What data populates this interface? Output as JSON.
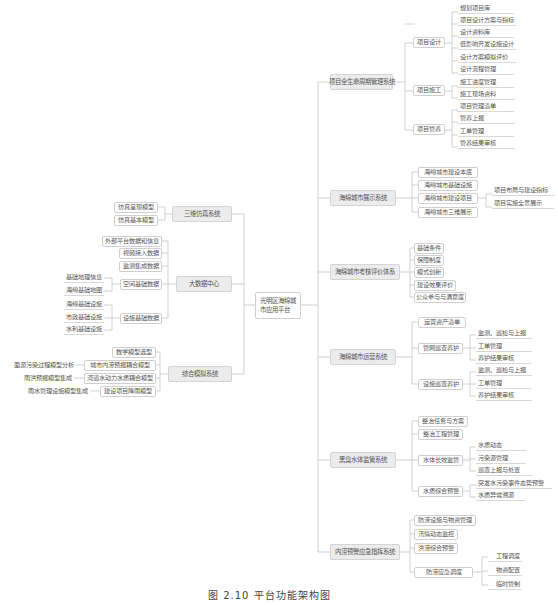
{
  "root": {
    "label": "光明区海绵城市应用平台"
  },
  "right_branches": [
    {
      "label": "项目全生命周期管理系统",
      "children": [
        {
          "label": "项目设计",
          "children": [
            "规划项目库",
            "项目设计方案与指标",
            "设计资料库",
            "低影响开发设施设计",
            "设计方案模拟评价",
            "设计流程管理"
          ]
        },
        {
          "label": "项目施工",
          "children": [
            "施工进度管理",
            "施工现场资料"
          ]
        },
        {
          "label": "项目管养",
          "children": [
            "项目管理清单",
            "管养上报",
            "工单管理",
            "管养结果审核"
          ]
        }
      ]
    },
    {
      "label": "海绵城市展示系统",
      "children": [
        {
          "label": "海绵城市建设本底",
          "children": []
        },
        {
          "label": "海绵城市基础设施",
          "children": []
        },
        {
          "label": "海绵城市建设项目",
          "children": [
            "项目布局与建设指标",
            "项目实施全景展示"
          ]
        },
        {
          "label": "海绵城市三维展示",
          "children": []
        }
      ]
    },
    {
      "label": "海绵城市考核评价体系",
      "children": [
        {
          "label": "基础条件",
          "children": []
        },
        {
          "label": "保障制度",
          "children": []
        },
        {
          "label": "模式创新",
          "children": []
        },
        {
          "label": "建设效果评价",
          "children": []
        },
        {
          "label": "公众参与与满意度",
          "children": []
        }
      ]
    },
    {
      "label": "海绵城市运营系统",
      "children": [
        {
          "label": "运营资产清单",
          "children": []
        },
        {
          "label": "管网巡查养护",
          "children": [
            "监测、巡检与上报",
            "工单管理",
            "养护结果审核"
          ]
        },
        {
          "label": "设施巡查养护",
          "children": [
            "监测、巡检与上报",
            "工单管理",
            "养护结果审核"
          ]
        }
      ]
    },
    {
      "label": "黑臭水体监管系统",
      "children": [
        {
          "label": "整治任务与方案",
          "children": []
        },
        {
          "label": "整治工程管理",
          "children": []
        },
        {
          "label": "水体长效监管",
          "children": [
            "水质动态",
            "污染源管理",
            "巡查上报与处置"
          ]
        },
        {
          "label": "水质综合预警",
          "children": [
            "突发水污染事件态势预警",
            "水质异常溯源"
          ]
        }
      ]
    },
    {
      "label": "内涝预警应急指挥系统",
      "children": [
        {
          "label": "防涝设施与物资管理",
          "children": []
        },
        {
          "label": "汛情动态监控",
          "children": []
        },
        {
          "label": "洪涝综合预警",
          "children": []
        },
        {
          "label": "防涝应急调度",
          "children": [
            "工程调度",
            "物资配置",
            "临时管制"
          ]
        }
      ]
    }
  ],
  "left_branches": [
    {
      "label": "三维仿真系统",
      "children": [
        {
          "label": "仿真呈现模型",
          "children": []
        },
        {
          "label": "仿真基本模型",
          "children": []
        }
      ]
    },
    {
      "label": "大数据中心",
      "children": [
        {
          "label": "外部平台数据和信息",
          "children": []
        },
        {
          "label": "视频接入数据",
          "children": []
        },
        {
          "label": "监测集成数据",
          "children": []
        },
        {
          "label": "空间基础数据",
          "children": [
            "基础地理信息",
            "海绵基础地图"
          ]
        },
        {
          "label": "设施基础数据",
          "children": [
            "海绵基础设施",
            "市政基础设施",
            "水利基础设施"
          ]
        }
      ]
    },
    {
      "label": "综合模拟系统",
      "children": [
        {
          "label": "数学模型选型",
          "children": []
        },
        {
          "label": "城市内涝预报耦合模型",
          "children": [
            "面源污染过程模型分析"
          ]
        },
        {
          "label": "河道水动力水质耦合模型",
          "children": [
            "雨洪预报模型集成"
          ]
        },
        {
          "label": "建设项目降雨模型",
          "children": [
            "雨水管理设施模型集成"
          ]
        }
      ]
    }
  ],
  "caption": "图 2.10  平台功能架构图",
  "colors": {
    "line": "#bdbdbd",
    "l1_fill": "#ececec",
    "border": "#cfcfcf",
    "text": "#555555"
  }
}
